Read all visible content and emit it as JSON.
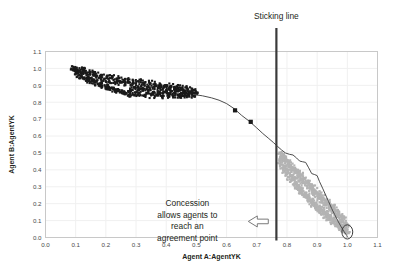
{
  "chart_data": {
    "type": "scatter",
    "title": "",
    "xlabel": "Agent A:AgentYK",
    "ylabel": "Agent B:AgentYK",
    "xlim": [
      0.0,
      1.1
    ],
    "ylim": [
      0.0,
      1.1
    ],
    "grid": true,
    "legend": "none",
    "xticks": [
      "0.0",
      "0.1",
      "0.2",
      "0.3",
      "0.4",
      "0.5",
      "0.6",
      "0.7",
      "0.8",
      "0.9",
      "1.0",
      "1.1"
    ],
    "yticks": [
      "0.0",
      "0.1",
      "0.2",
      "0.3",
      "0.4",
      "0.5",
      "0.6",
      "0.7",
      "0.8",
      "0.9",
      "1.0",
      "1.1"
    ],
    "xtick_values": [
      0.0,
      0.1,
      0.2,
      0.3,
      0.4,
      0.5,
      0.6,
      0.7,
      0.8,
      0.9,
      1.0,
      1.1
    ],
    "ytick_values": [
      0.0,
      0.1,
      0.2,
      0.3,
      0.4,
      0.5,
      0.6,
      0.7,
      0.8,
      0.9,
      1.0,
      1.1
    ],
    "series": [
      {
        "name": "agent-a-bid-cloud",
        "type": "scatter",
        "color": "#1a1a1a",
        "marker": "square",
        "marker_size": 2.1,
        "description": "Dense dark cloud of Agent A offers in the upper-left region",
        "x_range": [
          0.09,
          0.5
        ],
        "y_range": [
          0.835,
          1.005
        ],
        "points": [
          [
            0.092,
            0.999
          ],
          [
            0.096,
            0.985
          ],
          [
            0.101,
            0.996
          ],
          [
            0.104,
            0.972
          ],
          [
            0.108,
            0.988
          ],
          [
            0.112,
            0.964
          ],
          [
            0.116,
            0.979
          ],
          [
            0.12,
            0.955
          ],
          [
            0.124,
            0.991
          ],
          [
            0.129,
            0.947
          ],
          [
            0.133,
            0.973
          ],
          [
            0.137,
            0.938
          ],
          [
            0.141,
            0.962
          ],
          [
            0.146,
            0.931
          ],
          [
            0.15,
            0.978
          ],
          [
            0.154,
            0.925
          ],
          [
            0.159,
            0.957
          ],
          [
            0.163,
            0.918
          ],
          [
            0.167,
            0.969
          ],
          [
            0.172,
            0.911
          ],
          [
            0.176,
            0.944
          ],
          [
            0.18,
            0.905
          ],
          [
            0.185,
            0.96
          ],
          [
            0.189,
            0.899
          ],
          [
            0.193,
            0.935
          ],
          [
            0.198,
            0.893
          ],
          [
            0.202,
            0.951
          ],
          [
            0.207,
            0.888
          ],
          [
            0.211,
            0.928
          ],
          [
            0.215,
            0.882
          ],
          [
            0.22,
            0.946
          ],
          [
            0.224,
            0.877
          ],
          [
            0.229,
            0.921
          ],
          [
            0.233,
            0.871
          ],
          [
            0.238,
            0.94
          ],
          [
            0.242,
            0.866
          ],
          [
            0.246,
            0.915
          ],
          [
            0.251,
            0.861
          ],
          [
            0.255,
            0.934
          ],
          [
            0.26,
            0.857
          ],
          [
            0.264,
            0.909
          ],
          [
            0.269,
            0.852
          ],
          [
            0.273,
            0.929
          ],
          [
            0.278,
            0.848
          ],
          [
            0.282,
            0.904
          ],
          [
            0.287,
            0.875
          ],
          [
            0.291,
            0.925
          ],
          [
            0.296,
            0.845
          ],
          [
            0.3,
            0.899
          ],
          [
            0.305,
            0.871
          ],
          [
            0.309,
            0.921
          ],
          [
            0.314,
            0.843
          ],
          [
            0.318,
            0.895
          ],
          [
            0.323,
            0.868
          ],
          [
            0.327,
            0.917
          ],
          [
            0.332,
            0.841
          ],
          [
            0.336,
            0.891
          ],
          [
            0.341,
            0.865
          ],
          [
            0.345,
            0.913
          ],
          [
            0.35,
            0.84
          ],
          [
            0.354,
            0.888
          ],
          [
            0.359,
            0.862
          ],
          [
            0.363,
            0.909
          ],
          [
            0.368,
            0.839
          ],
          [
            0.372,
            0.885
          ],
          [
            0.377,
            0.86
          ],
          [
            0.381,
            0.905
          ],
          [
            0.386,
            0.838
          ],
          [
            0.39,
            0.882
          ],
          [
            0.395,
            0.858
          ],
          [
            0.399,
            0.901
          ],
          [
            0.404,
            0.838
          ],
          [
            0.408,
            0.879
          ],
          [
            0.413,
            0.856
          ],
          [
            0.417,
            0.897
          ],
          [
            0.422,
            0.838
          ],
          [
            0.426,
            0.876
          ],
          [
            0.431,
            0.855
          ],
          [
            0.435,
            0.892
          ],
          [
            0.44,
            0.839
          ],
          [
            0.444,
            0.872
          ],
          [
            0.449,
            0.854
          ],
          [
            0.453,
            0.887
          ],
          [
            0.458,
            0.84
          ],
          [
            0.462,
            0.868
          ],
          [
            0.467,
            0.853
          ],
          [
            0.471,
            0.881
          ],
          [
            0.476,
            0.842
          ],
          [
            0.48,
            0.863
          ],
          [
            0.485,
            0.851
          ],
          [
            0.489,
            0.872
          ],
          [
            0.494,
            0.845
          ],
          [
            0.498,
            0.857
          ]
        ]
      },
      {
        "name": "agent-b-bid-cloud",
        "type": "scatter",
        "color": "#b3b3b3",
        "marker": "square",
        "marker_size": 2.1,
        "description": "Diagonal grey band of Agent B offers descending to the lower-right",
        "x_range": [
          0.775,
          1.005
        ],
        "y_range": [
          0.01,
          0.52
        ],
        "points": [
          [
            0.782,
            0.497
          ],
          [
            0.786,
            0.452
          ],
          [
            0.79,
            0.478
          ],
          [
            0.794,
            0.421
          ],
          [
            0.798,
            0.462
          ],
          [
            0.802,
            0.398
          ],
          [
            0.806,
            0.444
          ],
          [
            0.81,
            0.376
          ],
          [
            0.814,
            0.43
          ],
          [
            0.818,
            0.355
          ],
          [
            0.822,
            0.413
          ],
          [
            0.826,
            0.338
          ],
          [
            0.83,
            0.398
          ],
          [
            0.834,
            0.318
          ],
          [
            0.838,
            0.383
          ],
          [
            0.842,
            0.3
          ],
          [
            0.846,
            0.368
          ],
          [
            0.85,
            0.283
          ],
          [
            0.854,
            0.352
          ],
          [
            0.858,
            0.266
          ],
          [
            0.862,
            0.338
          ],
          [
            0.866,
            0.25
          ],
          [
            0.87,
            0.322
          ],
          [
            0.874,
            0.235
          ],
          [
            0.878,
            0.308
          ],
          [
            0.882,
            0.22
          ],
          [
            0.886,
            0.294
          ],
          [
            0.89,
            0.206
          ],
          [
            0.894,
            0.279
          ],
          [
            0.898,
            0.192
          ],
          [
            0.902,
            0.265
          ],
          [
            0.906,
            0.179
          ],
          [
            0.91,
            0.251
          ],
          [
            0.914,
            0.166
          ],
          [
            0.918,
            0.237
          ],
          [
            0.922,
            0.154
          ],
          [
            0.926,
            0.223
          ],
          [
            0.93,
            0.142
          ],
          [
            0.934,
            0.209
          ],
          [
            0.938,
            0.13
          ],
          [
            0.942,
            0.196
          ],
          [
            0.946,
            0.119
          ],
          [
            0.95,
            0.182
          ],
          [
            0.954,
            0.108
          ],
          [
            0.958,
            0.168
          ],
          [
            0.962,
            0.097
          ],
          [
            0.966,
            0.154
          ],
          [
            0.97,
            0.086
          ],
          [
            0.974,
            0.14
          ],
          [
            0.978,
            0.075
          ],
          [
            0.982,
            0.125
          ],
          [
            0.986,
            0.063
          ],
          [
            0.99,
            0.108
          ],
          [
            0.994,
            0.048
          ],
          [
            0.998,
            0.084
          ],
          [
            1.0,
            0.03
          ],
          [
            0.996,
            0.062
          ],
          [
            0.992,
            0.038
          ],
          [
            0.988,
            0.09
          ],
          [
            0.984,
            0.045
          ],
          [
            0.98,
            0.102
          ],
          [
            0.976,
            0.056
          ],
          [
            0.972,
            0.118
          ],
          [
            0.968,
            0.068
          ],
          [
            0.964,
            0.133
          ],
          [
            0.96,
            0.08
          ],
          [
            0.956,
            0.147
          ],
          [
            0.952,
            0.092
          ],
          [
            0.948,
            0.161
          ],
          [
            0.944,
            0.104
          ],
          [
            0.94,
            0.175
          ],
          [
            0.936,
            0.116
          ],
          [
            0.932,
            0.189
          ],
          [
            0.928,
            0.128
          ],
          [
            0.924,
            0.203
          ],
          [
            0.92,
            0.141
          ],
          [
            0.916,
            0.217
          ],
          [
            0.912,
            0.154
          ],
          [
            0.908,
            0.231
          ],
          [
            0.904,
            0.167
          ],
          [
            0.9,
            0.245
          ],
          [
            0.896,
            0.18
          ],
          [
            0.892,
            0.259
          ],
          [
            0.888,
            0.194
          ],
          [
            0.884,
            0.273
          ],
          [
            0.88,
            0.208
          ],
          [
            0.876,
            0.288
          ],
          [
            0.872,
            0.222
          ],
          [
            0.868,
            0.303
          ],
          [
            0.864,
            0.237
          ],
          [
            0.86,
            0.318
          ],
          [
            0.856,
            0.252
          ],
          [
            0.852,
            0.333
          ],
          [
            0.848,
            0.268
          ],
          [
            0.844,
            0.349
          ],
          [
            0.84,
            0.284
          ],
          [
            0.836,
            0.365
          ],
          [
            0.832,
            0.301
          ],
          [
            0.828,
            0.381
          ],
          [
            0.824,
            0.318
          ],
          [
            0.82,
            0.397
          ],
          [
            0.816,
            0.336
          ],
          [
            0.812,
            0.414
          ],
          [
            0.808,
            0.354
          ],
          [
            0.804,
            0.431
          ],
          [
            0.8,
            0.373
          ],
          [
            0.796,
            0.448
          ],
          [
            0.792,
            0.392
          ],
          [
            0.788,
            0.466
          ],
          [
            0.784,
            0.412
          ],
          [
            0.78,
            0.484
          ],
          [
            0.778,
            0.435
          ],
          [
            0.776,
            0.46
          ]
        ]
      },
      {
        "name": "pareto-frontier",
        "type": "line",
        "color": "#4d4d4d",
        "description": "Pareto-optimal frontier curve running from the dark cloud down to the agreement point",
        "points": [
          [
            0.49,
            0.846
          ],
          [
            0.52,
            0.838
          ],
          [
            0.55,
            0.826
          ],
          [
            0.575,
            0.812
          ],
          [
            0.6,
            0.792
          ],
          [
            0.625,
            0.762
          ],
          [
            0.65,
            0.722
          ],
          [
            0.675,
            0.688
          ],
          [
            0.7,
            0.648
          ],
          [
            0.72,
            0.615
          ],
          [
            0.74,
            0.585
          ],
          [
            0.755,
            0.562
          ],
          [
            0.768,
            0.54
          ],
          [
            0.782,
            0.518
          ],
          [
            0.795,
            0.5
          ],
          [
            0.808,
            0.492
          ],
          [
            0.82,
            0.488
          ],
          [
            0.832,
            0.47
          ],
          [
            0.842,
            0.452
          ],
          [
            0.852,
            0.448
          ],
          [
            0.862,
            0.444
          ],
          [
            0.872,
            0.412
          ],
          [
            0.882,
            0.378
          ],
          [
            0.892,
            0.372
          ],
          [
            0.9,
            0.366
          ],
          [
            0.908,
            0.33
          ],
          [
            0.918,
            0.292
          ],
          [
            0.928,
            0.252
          ],
          [
            0.938,
            0.212
          ],
          [
            0.948,
            0.172
          ],
          [
            0.958,
            0.136
          ],
          [
            0.968,
            0.1
          ],
          [
            0.978,
            0.068
          ],
          [
            0.988,
            0.038
          ],
          [
            0.998,
            0.012
          ],
          [
            1.0,
            0.004
          ]
        ]
      },
      {
        "name": "highlighted-offer-markers",
        "type": "scatter",
        "color": "#1a1a1a",
        "marker": "square",
        "marker_size": 4.2,
        "description": "Two larger square markers sitting on the frontier between the clouds",
        "points": [
          [
            0.628,
            0.752
          ],
          [
            0.68,
            0.684
          ]
        ]
      }
    ],
    "annotations": [
      {
        "name": "sticking-line",
        "type": "vline",
        "x": 0.765,
        "label": "Sticking line",
        "color": "#3a3a3a",
        "line_width": 2.2
      },
      {
        "name": "concession-callout",
        "type": "text",
        "lines": [
          "Concession",
          "allows agents  to",
          "reach an",
          "agreement point"
        ],
        "x": 0.47,
        "y": 0.185,
        "align": "center"
      },
      {
        "name": "concession-arrow",
        "type": "block-arrow",
        "direction": "left",
        "x": 0.705,
        "y": 0.095,
        "fill": "#ffffff",
        "stroke": "#7a7a7a"
      },
      {
        "name": "agreement-point-ellipse",
        "type": "ellipse",
        "cx": 1.0,
        "cy": 0.033,
        "rx": 0.018,
        "ry": 0.042,
        "fill": "none",
        "stroke": "#3a3a3a"
      }
    ],
    "colors": {
      "agent_a_cloud": "#1a1a1a",
      "agent_b_cloud": "#b3b3b3",
      "frontier": "#4d4d4d",
      "sticking_line": "#3a3a3a",
      "grid": "#f0f0f0",
      "axis": "#c8c8c8",
      "background": "#ffffff",
      "text": "#231f20"
    }
  }
}
